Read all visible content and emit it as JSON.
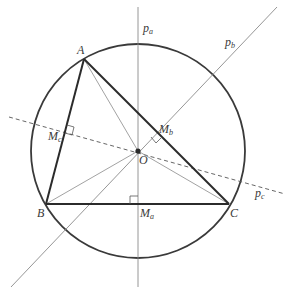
{
  "diagram": {
    "colors": {
      "background": "#ffffff",
      "stroke_dark": "#2b2b2b",
      "stroke_thin": "#8a8a8a",
      "circle": "#3a3a3a",
      "center_point": "#2b2b2b",
      "label": "#3a3a3a"
    },
    "circle": {
      "cx": 138,
      "cy": 151,
      "r": 107
    },
    "points": {
      "A": {
        "x": 84,
        "y": 59,
        "label": "A"
      },
      "B": {
        "x": 46,
        "y": 204,
        "label": "B"
      },
      "C": {
        "x": 229,
        "y": 204,
        "label": "C"
      },
      "O": {
        "x": 138,
        "y": 151,
        "label": "O"
      }
    },
    "midpoints": {
      "Ma": {
        "x": 138,
        "y": 204,
        "label": "M",
        "sub": "a"
      },
      "Mb": {
        "x": 157,
        "y": 131,
        "label": "M",
        "sub": "b"
      },
      "Mc": {
        "x": 65,
        "y": 132,
        "label": "M",
        "sub": "c"
      }
    },
    "bisectors": {
      "pa": {
        "x1": 138,
        "y1": 7,
        "x2": 138,
        "y2": 287,
        "label": "p",
        "sub": "a",
        "style": "solid"
      },
      "pb": {
        "x1": 277,
        "y1": 7,
        "x2": 11,
        "y2": 287,
        "label": "p",
        "sub": "b",
        "style": "solid"
      },
      "pc": {
        "x1": 9,
        "y1": 117,
        "x2": 285,
        "y2": 194,
        "label": "p",
        "sub": "c",
        "style": "dashed"
      }
    },
    "labels": {
      "A": "A",
      "B": "B",
      "C": "C",
      "O": "O",
      "Ma_main": "M",
      "Ma_sub": "a",
      "Mb_main": "M",
      "Mb_sub": "b",
      "Mc_main": "M",
      "Mc_sub": "c",
      "pa_main": "p",
      "pa_sub": "a",
      "pb_main": "p",
      "pb_sub": "b",
      "pc_main": "p",
      "pc_sub": "c"
    }
  }
}
